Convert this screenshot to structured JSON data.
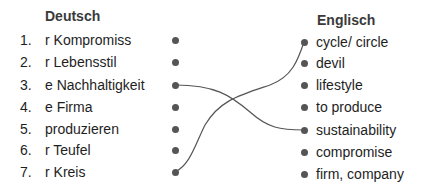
{
  "headers": {
    "left": "Deutsch",
    "right": "Englisch"
  },
  "left_items": [
    {
      "num": "1.",
      "label": "r Kompromiss"
    },
    {
      "num": "2.",
      "label": "r Lebensstil"
    },
    {
      "num": "3.",
      "label": "e Nachhaltigkeit"
    },
    {
      "num": "4.",
      "label": "e Firma"
    },
    {
      "num": "5.",
      "label": "produzieren"
    },
    {
      "num": "6.",
      "label": "r Teufel"
    },
    {
      "num": "7.",
      "label": "r Kreis"
    }
  ],
  "right_items": [
    {
      "label": "cycle/ circle"
    },
    {
      "label": "devil"
    },
    {
      "label": "lifestyle"
    },
    {
      "label": "to produce"
    },
    {
      "label": "sustainability"
    },
    {
      "label": "compromise"
    },
    {
      "label": "firm, company"
    }
  ],
  "connections": [
    {
      "from": 3,
      "to": "sustainability"
    },
    {
      "from": 7,
      "to": "cycle/ circle"
    }
  ],
  "colors": {
    "line": "#555555",
    "dot": "#555555",
    "text": "#1e1e1e"
  }
}
